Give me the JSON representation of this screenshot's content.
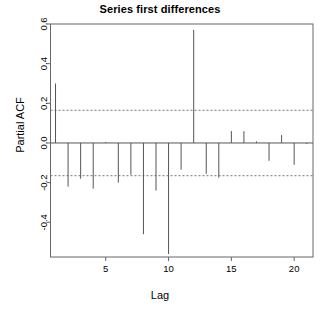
{
  "chart_data": {
    "type": "bar",
    "title": "Series first differences",
    "xlabel": "Lag",
    "ylabel": "Partial ACF",
    "x": [
      1,
      2,
      3,
      4,
      5,
      6,
      7,
      8,
      9,
      10,
      11,
      12,
      13,
      14,
      15,
      16,
      17,
      18,
      19,
      20,
      21
    ],
    "values": [
      0.3,
      -0.22,
      -0.18,
      -0.23,
      0.005,
      -0.2,
      -0.16,
      -0.46,
      -0.24,
      -0.56,
      -0.135,
      0.57,
      -0.155,
      -0.175,
      0.06,
      0.06,
      0.008,
      -0.09,
      0.04,
      -0.11,
      -0.005
    ],
    "categories": [
      "1",
      "2",
      "3",
      "4",
      "5",
      "6",
      "7",
      "8",
      "9",
      "10",
      "11",
      "12",
      "13",
      "14",
      "15",
      "16",
      "17",
      "18",
      "19",
      "20",
      "21"
    ],
    "xlim": [
      0.6,
      21.5
    ],
    "ylim": [
      -0.56,
      0.6
    ],
    "xticks": [
      5,
      10,
      15,
      20
    ],
    "xtick_labels": [
      "5",
      "10",
      "15",
      "20"
    ],
    "yticks": [
      0.6,
      0.4,
      0.2,
      0.0,
      -0.2,
      -0.4
    ],
    "ytick_labels": [
      "0.6",
      "0.4",
      "0.2",
      "0.0",
      "-0.2",
      "-0.4"
    ],
    "confidence_bounds": [
      0.165,
      -0.165
    ],
    "confidence_line_style": "dashed",
    "zero_line": 0.0,
    "grid": false,
    "legend": null,
    "series_color": "#555555",
    "axis_color": "#666666",
    "background": "#ffffff"
  }
}
